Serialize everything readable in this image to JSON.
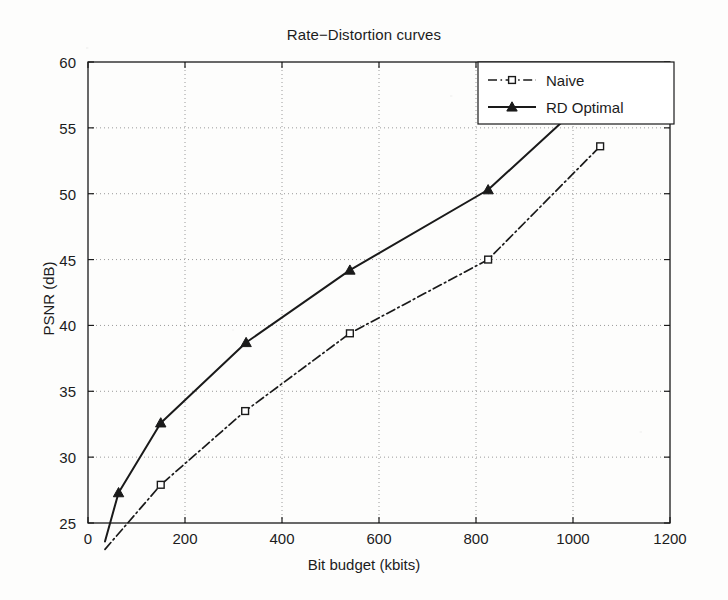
{
  "chart_data": {
    "type": "line",
    "title": "Rate−Distortion curves",
    "xlabel": "Bit budget (kbits)",
    "ylabel": "PSNR (dB)",
    "xlim": [
      0,
      1200
    ],
    "ylim": [
      25,
      60
    ],
    "xticks": [
      0,
      200,
      400,
      600,
      800,
      1000,
      1200
    ],
    "yticks": [
      25,
      30,
      35,
      40,
      45,
      50,
      55,
      60
    ],
    "xtick_labels": [
      "0",
      "200",
      "400",
      "600",
      "800",
      "1000",
      "1200"
    ],
    "ytick_labels": [
      "25",
      "30",
      "35",
      "40",
      "45",
      "50",
      "55",
      "60"
    ],
    "grid": true,
    "grid_style": "dotted",
    "legend_position": "top-right",
    "series": [
      {
        "name": "Naive",
        "line_style": "dash-dot",
        "marker": "square",
        "color": "#1a1a1a",
        "x": [
          35,
          150,
          324,
          540,
          825,
          1056
        ],
        "y": [
          23.0,
          27.9,
          33.5,
          39.4,
          45.0,
          53.6
        ]
      },
      {
        "name": "RD Optimal",
        "line_style": "solid",
        "marker": "triangle",
        "color": "#1a1a1a",
        "x": [
          35,
          63,
          150,
          326,
          540,
          825,
          1056
        ],
        "y": [
          23.6,
          27.3,
          32.6,
          38.7,
          44.2,
          50.3,
          58.1
        ]
      }
    ]
  },
  "legend": {
    "entries": [
      {
        "label": "Naive"
      },
      {
        "label": "RD Optimal"
      }
    ]
  },
  "colors": {
    "ink": "#1a1a1a",
    "grid": "#9a9a9a",
    "paper": "#fdfdfc"
  }
}
